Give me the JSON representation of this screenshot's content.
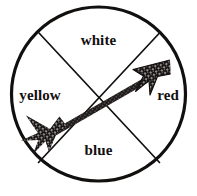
{
  "figure": {
    "type": "circle-quadrant-diagram-with-arrow",
    "background_color": "#ffffff",
    "ink_color": "#12100f"
  },
  "circle": {
    "center_x": 98.5,
    "center_y": 94,
    "radius": 88,
    "stroke_width": 3
  },
  "dividers": [
    {
      "name": "divider-nwse",
      "from_x": 39,
      "from_y": 33,
      "to_x": 159,
      "to_y": 162
    },
    {
      "name": "divider-nesw",
      "from_x": 159,
      "from_y": 33,
      "to_x": 39,
      "to_y": 162
    }
  ],
  "arrow": {
    "name": "diagonal-arrow",
    "direction": "lower-left to upper-right",
    "tail_x": 36,
    "tail_y": 135,
    "tip_x": 166,
    "tip_y": 62,
    "shaft_width": 6,
    "fill": "#1b1817",
    "texture": "halftone-dither"
  },
  "labels": {
    "top": "white",
    "left": "yellow",
    "right": "red",
    "bottom": "blue"
  }
}
